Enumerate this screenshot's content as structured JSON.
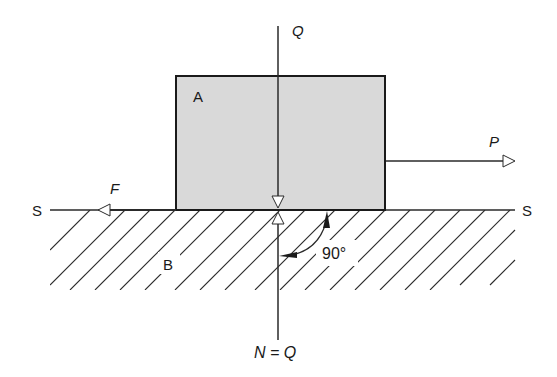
{
  "diagram": {
    "labels": {
      "block": "A",
      "surface": "B",
      "surface_left": "S",
      "surface_right": "S",
      "load_force": "Q",
      "pull_force": "P",
      "friction_force": "F",
      "normal_force": "N = Q",
      "angle": "90°"
    },
    "colors": {
      "block_fill": "#d9d9d9",
      "line": "#2a2a2a",
      "background": "#ffffff"
    }
  }
}
